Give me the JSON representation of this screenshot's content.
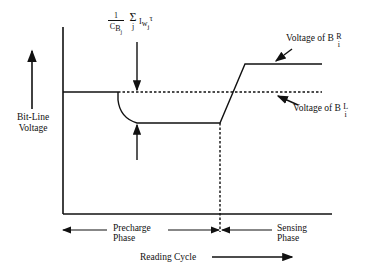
{
  "diagram": {
    "y_axis_label": [
      "Bit-Line",
      "Voltage"
    ],
    "formula": {
      "numerator": "1",
      "denominator": "C",
      "denominator_sub": "B",
      "denominator_subsub": "j",
      "sum": "Σ",
      "sum_index": "j",
      "term": "I",
      "term_sub": "w",
      "term_subsub": "j",
      "tau": "τ"
    },
    "curve_labels": {
      "right": {
        "text": "Voltage of B",
        "sup": "R",
        "sub": "i"
      },
      "left": {
        "text": "Voltage of B",
        "sup": "L",
        "sub": "i"
      }
    },
    "phases": {
      "precharge": [
        "Precharge",
        "Phase"
      ],
      "sensing": [
        "Sensing",
        "Phase"
      ]
    },
    "x_axis_label": "Reading Cycle",
    "colors": {
      "line": "#111111",
      "background": "#ffffff"
    }
  }
}
